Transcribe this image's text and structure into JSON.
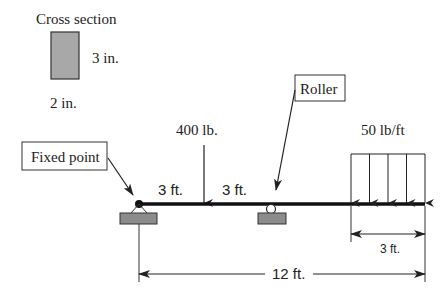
{
  "cross_section": {
    "title": "Cross section",
    "height_label": "3 in.",
    "width_label": "2 in.",
    "fill_color": "#a8a8a8"
  },
  "callouts": {
    "fixed_point": "Fixed point",
    "roller": "Roller"
  },
  "loads": {
    "point_load": "400 lb.",
    "distributed_load": "50 lb/ft"
  },
  "dimensions": {
    "segment_1": "3 ft.",
    "segment_2": "3 ft.",
    "distributed_length": "3 ft.",
    "total_length": "12 ft."
  },
  "colors": {
    "beam": "#111111",
    "support": "#8c8c8c",
    "line": "#333333"
  }
}
